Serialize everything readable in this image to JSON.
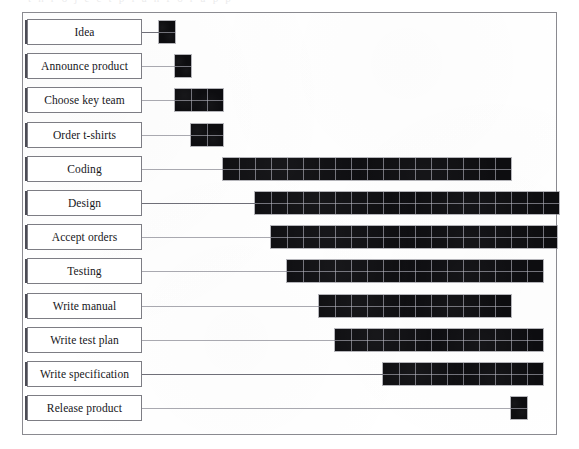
{
  "artifact": {
    "top_clipped_text": "t  n  r  o  j  e  c  t   p  l  a  n   f  o  r   a   p  p"
  },
  "colors": {
    "bar_fill": "#0d0d10",
    "bar_grid": "#b0b0ba",
    "frame_border": "#8a8a90",
    "label_border": "#7d7d84",
    "connector": "#a9a9b0",
    "text": "#16161a",
    "background": "#ffffff"
  },
  "chart_data": {
    "type": "bar",
    "chart_style": "gantt",
    "title": "",
    "xlabel": "",
    "ylabel": "",
    "grid": true,
    "legend": "none",
    "axis_note": "Time axis is unlabeled; durations are read as cell counts (1 cell = 1 time unit).",
    "cell_width_px": 16,
    "time_origin_px": 158,
    "categories": [
      "Idea",
      "Announce product",
      "Choose key team",
      "Order t-shirts",
      "Coding",
      "Design",
      "Accept orders",
      "Testing",
      "Write manual",
      "Write test plan",
      "Write specification",
      "Release product"
    ],
    "tasks": [
      {
        "label": "Idea",
        "start": 0,
        "duration": 1,
        "start_px": 158,
        "width_px": 16,
        "clipped_right": false,
        "connector": "strong"
      },
      {
        "label": "Announce product",
        "start": 1,
        "duration": 1,
        "start_px": 174,
        "width_px": 16,
        "clipped_right": false,
        "connector": "light"
      },
      {
        "label": "Choose key team",
        "start": 1,
        "duration": 3,
        "start_px": 174,
        "width_px": 48,
        "clipped_right": false,
        "connector": "light"
      },
      {
        "label": "Order t-shirts",
        "start": 2,
        "duration": 2,
        "start_px": 190,
        "width_px": 32,
        "clipped_right": false,
        "connector": "light"
      },
      {
        "label": "Coding",
        "start": 4,
        "duration": 18,
        "start_px": 222,
        "width_px": 288,
        "clipped_right": false,
        "connector": "light"
      },
      {
        "label": "Design",
        "start": 6,
        "duration": 19,
        "start_px": 254,
        "width_px": 304,
        "clipped_right": false,
        "connector": "strong"
      },
      {
        "label": "Accept orders",
        "start": 7,
        "duration": 19,
        "start_px": 270,
        "width_px": 287,
        "clipped_right": true,
        "connector": "light"
      },
      {
        "label": "Testing",
        "start": 8,
        "duration": 16,
        "start_px": 286,
        "width_px": 256,
        "clipped_right": false,
        "connector": "light"
      },
      {
        "label": "Write manual",
        "start": 10,
        "duration": 12,
        "start_px": 318,
        "width_px": 192,
        "clipped_right": false,
        "connector": "light"
      },
      {
        "label": "Write test plan",
        "start": 11,
        "duration": 13,
        "start_px": 334,
        "width_px": 208,
        "clipped_right": false,
        "connector": "light"
      },
      {
        "label": "Write specification",
        "start": 14,
        "duration": 10,
        "start_px": 382,
        "width_px": 160,
        "clipped_right": false,
        "connector": "strong"
      },
      {
        "label": "Release product",
        "start": 22,
        "duration": 1,
        "start_px": 510,
        "width_px": 16,
        "clipped_right": false,
        "connector": "light"
      }
    ],
    "values": [
      1,
      1,
      3,
      2,
      18,
      19,
      19,
      16,
      12,
      13,
      10,
      1
    ],
    "starts": [
      0,
      1,
      1,
      2,
      4,
      6,
      7,
      8,
      10,
      11,
      14,
      22
    ]
  }
}
